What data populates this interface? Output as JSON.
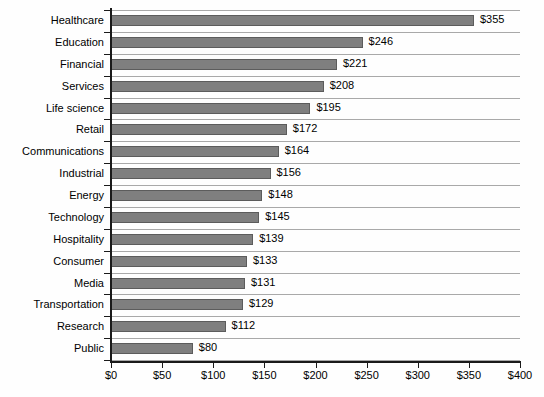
{
  "chart_data": {
    "type": "bar",
    "orientation": "horizontal",
    "title": "",
    "subtitle": "",
    "xlabel": "",
    "ylabel": "",
    "xlim": [
      0,
      400
    ],
    "xticks": [
      0,
      50,
      100,
      150,
      200,
      250,
      300,
      350,
      400
    ],
    "xtick_labels": [
      "$0",
      "$50",
      "$100",
      "$150",
      "$200",
      "$250",
      "$300",
      "$350",
      "$400"
    ],
    "grid": true,
    "grid_axis": "y",
    "legend": false,
    "legend_position": "none",
    "value_prefix": "$",
    "categories": [
      "Healthcare",
      "Education",
      "Financial",
      "Services",
      "Life science",
      "Retail",
      "Communications",
      "Industrial",
      "Energy",
      "Technology",
      "Hospitality",
      "Consumer",
      "Media",
      "Transportation",
      "Research",
      "Public"
    ],
    "values": [
      355,
      246,
      221,
      208,
      195,
      172,
      164,
      156,
      148,
      145,
      139,
      133,
      131,
      129,
      112,
      80
    ],
    "data_labels": [
      "$355",
      "$246",
      "$221",
      "$208",
      "$195",
      "$172",
      "$164",
      "$156",
      "$148",
      "$145",
      "$139",
      "$133",
      "$131",
      "$129",
      "$112",
      "$80"
    ],
    "colors": {
      "bar_fill": "#7f7f7f",
      "bar_border": "#5c5c5c",
      "gridline": "#a9a9a9",
      "axis": "#1a1a1a",
      "text": "#000000",
      "background": "#fefefe"
    }
  }
}
